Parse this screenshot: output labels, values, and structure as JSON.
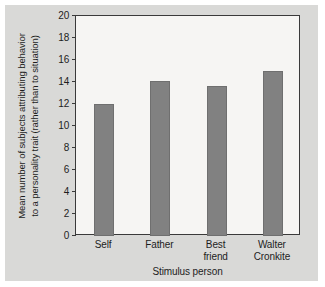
{
  "chart_data": {
    "type": "bar",
    "title": "",
    "categories": [
      "Self",
      "Father",
      "Best friend",
      "Walter Cronkite"
    ],
    "category_lines": [
      [
        "Self"
      ],
      [
        "Father"
      ],
      [
        "Best",
        "friend"
      ],
      [
        "Walter",
        "Cronkite"
      ]
    ],
    "values": [
      12.0,
      14.1,
      13.6,
      15.0
    ],
    "xlabel": "Stimulus person",
    "ylabel": "Mean number of subjects attributing behavior to a personality trait (rather than to situation)",
    "ylabel_lines": [
      "Mean number of subjects attributing behavior",
      "to a personality trait (rather than to situation)"
    ],
    "ylim": [
      0,
      20
    ],
    "ytick_values": [
      0,
      2,
      4,
      6,
      8,
      10,
      12,
      14,
      16,
      18,
      20
    ],
    "ytick_labels": [
      "0",
      "2",
      "4",
      "6",
      "8",
      "10",
      "12",
      "14",
      "16",
      "18",
      "20"
    ],
    "grid": false,
    "legend": null,
    "bar_color": "#818181",
    "plot_background": "#f6f5f3",
    "figure_background": "#d9d9d7",
    "axis_color": "#3a3a3a"
  }
}
